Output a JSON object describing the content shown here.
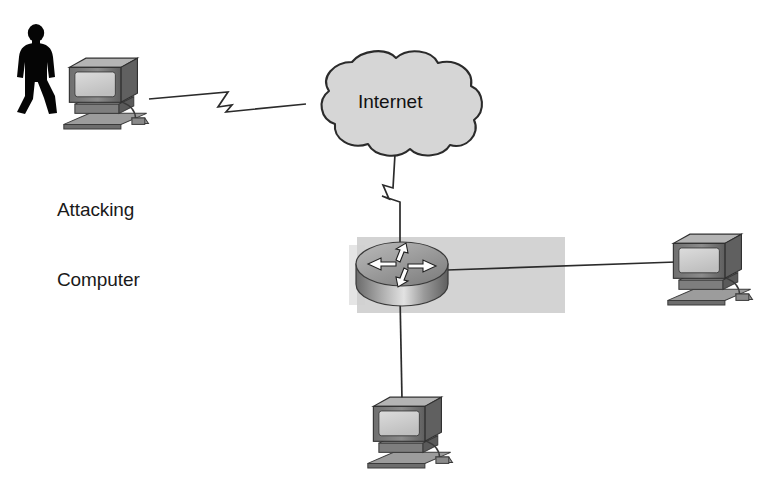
{
  "diagram": {
    "background_color": "#ffffff",
    "width": 764,
    "height": 479,
    "palette": {
      "line": "#2b2b2b",
      "cloud_fill": "#d6d6d6",
      "cloud_stroke": "#2b2b2b",
      "device_dark": "#4a4a4a",
      "device_mid": "#8a8a8a",
      "device_light": "#c9c9c9",
      "screen": "#cfcfcf",
      "silhouette": "#050505",
      "highlight_band": "#cfcfcf",
      "text": "#1a1a1a"
    }
  },
  "nodes": [
    {
      "id": "attacker-person",
      "icon": "person-silhouette-icon",
      "label": "",
      "x": 12,
      "y": 25
    },
    {
      "id": "attacking-computer",
      "icon": "desktop-computer-icon",
      "label_line1": "Attacking",
      "label_line2": "Computer",
      "x": 68,
      "y": 58
    },
    {
      "id": "internet-cloud",
      "icon": "cloud-icon",
      "label": "Internet",
      "x": 305,
      "y": 50
    },
    {
      "id": "edge-router",
      "icon": "router-icon",
      "label": "",
      "x": 355,
      "y": 240
    },
    {
      "id": "right-computer",
      "icon": "desktop-computer-icon",
      "label": "",
      "x": 668,
      "y": 230
    },
    {
      "id": "bottom-computer",
      "icon": "desktop-computer-icon",
      "label": "",
      "x": 368,
      "y": 393
    }
  ],
  "links": [
    {
      "id": "link-attacker-to-internet",
      "from": "attacking-computer",
      "to": "internet-cloud",
      "style": "serial-wan-zigzag"
    },
    {
      "id": "link-internet-to-router",
      "from": "internet-cloud",
      "to": "edge-router",
      "style": "serial-wan-zigzag"
    },
    {
      "id": "link-router-to-right-computer",
      "from": "edge-router",
      "to": "right-computer",
      "style": "ethernet-straight"
    },
    {
      "id": "link-router-to-bottom-computer",
      "from": "edge-router",
      "to": "bottom-computer",
      "style": "ethernet-straight"
    }
  ],
  "labels": {
    "attacking_computer_line1": "Attacking",
    "attacking_computer_line2": "Computer",
    "internet": "Internet"
  }
}
